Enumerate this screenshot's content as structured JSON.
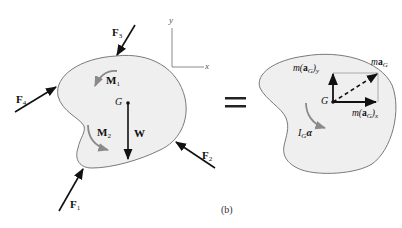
{
  "figure": {
    "caption": "(b)",
    "equals_sign": "=",
    "colors": {
      "body_fill": "#efefef",
      "body_outline": "#7a7a7a",
      "arrow": "#111111",
      "moment_arrow": "#8a8a8a",
      "axes": "#8a8a8a",
      "background": "#ffffff"
    }
  },
  "axes": {
    "x_label": "x",
    "y_label": "y"
  },
  "free_body_diagram": {
    "forces": [
      {
        "name": "F",
        "sub": "1"
      },
      {
        "name": "F",
        "sub": "2"
      },
      {
        "name": "F",
        "sub": "3"
      },
      {
        "name": "F",
        "sub": "4"
      }
    ],
    "moments": [
      {
        "name": "M",
        "sub": "1"
      },
      {
        "name": "M",
        "sub": "2"
      }
    ],
    "center_label": "G",
    "weight_label": "W"
  },
  "kinetic_diagram": {
    "center_label": "G",
    "may": {
      "m": "m(",
      "a": "a",
      "g": "G",
      "close": ")",
      "sub": "y"
    },
    "max": {
      "m": "m(",
      "a": "a",
      "g": "G",
      "close": ")",
      "sub": "x"
    },
    "mag": {
      "m": "m",
      "a": "a",
      "g": "G"
    },
    "inertia": {
      "i": "I",
      "g": "G",
      "alpha": "α"
    }
  }
}
